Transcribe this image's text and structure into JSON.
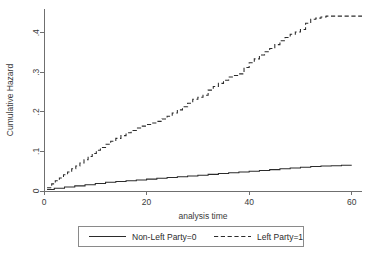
{
  "chart_data": {
    "type": "line",
    "title": "",
    "xlabel": "analysis time",
    "ylabel": "Cumulative Hazard",
    "xlim": [
      0,
      62
    ],
    "ylim": [
      0,
      0.46
    ],
    "xticks": [
      0,
      20,
      40,
      60
    ],
    "xtick_labels": [
      "0",
      "20",
      "40",
      "60"
    ],
    "yticks": [
      0,
      0.1,
      0.2,
      0.3,
      0.4
    ],
    "ytick_labels": [
      "0",
      ".1",
      ".2",
      ".3",
      ".4"
    ],
    "grid": false,
    "legend_position": "bottom-center",
    "series": [
      {
        "name": "Non-Left Party=0",
        "style": "solid",
        "color": "#2b2b2b",
        "step": "post",
        "x": [
          0.6,
          2,
          4,
          6,
          8,
          10,
          12,
          14,
          16,
          18,
          20,
          22,
          24,
          26,
          28,
          30,
          32,
          34,
          36,
          38,
          40,
          42,
          44,
          46,
          48,
          50,
          52,
          54,
          56,
          58,
          60
        ],
        "y": [
          0.004,
          0.007,
          0.01,
          0.013,
          0.016,
          0.019,
          0.022,
          0.024,
          0.026,
          0.028,
          0.03,
          0.032,
          0.034,
          0.036,
          0.038,
          0.04,
          0.042,
          0.044,
          0.046,
          0.048,
          0.05,
          0.052,
          0.054,
          0.056,
          0.058,
          0.06,
          0.062,
          0.063,
          0.064,
          0.065,
          0.065
        ]
      },
      {
        "name": "Left Party=1",
        "style": "dashed",
        "color": "#2b2b2b",
        "step": "post",
        "x": [
          0.6,
          1.5,
          2.2,
          3.0,
          3.8,
          4.6,
          5.4,
          6.2,
          7.0,
          7.8,
          8.6,
          9.4,
          10.2,
          11.0,
          12.0,
          13.0,
          14.0,
          15.0,
          16.0,
          17.0,
          18.0,
          19.0,
          20.0,
          21.0,
          22.0,
          23.0,
          24.0,
          25.0,
          26.0,
          27.0,
          28.0,
          29.0,
          30.0,
          31.0,
          32.0,
          33.0,
          34.0,
          35.0,
          36.0,
          37.0,
          38.0,
          39.0,
          40.0,
          41.0,
          42.0,
          43.0,
          44.0,
          45.0,
          46.0,
          47.0,
          48.0,
          49.0,
          50.0,
          51.0,
          52.0,
          53.0,
          54.0,
          55.0,
          62.0
        ],
        "y": [
          0.008,
          0.018,
          0.026,
          0.033,
          0.041,
          0.048,
          0.056,
          0.063,
          0.071,
          0.079,
          0.087,
          0.095,
          0.103,
          0.11,
          0.118,
          0.126,
          0.133,
          0.14,
          0.147,
          0.153,
          0.159,
          0.164,
          0.168,
          0.172,
          0.176,
          0.182,
          0.189,
          0.197,
          0.205,
          0.213,
          0.222,
          0.232,
          0.237,
          0.242,
          0.255,
          0.264,
          0.272,
          0.28,
          0.288,
          0.292,
          0.296,
          0.312,
          0.324,
          0.334,
          0.344,
          0.352,
          0.36,
          0.37,
          0.38,
          0.388,
          0.396,
          0.402,
          0.408,
          0.424,
          0.434,
          0.437,
          0.44,
          0.442,
          0.442
        ]
      }
    ]
  },
  "legend": {
    "entries": [
      {
        "label": "Non-Left Party=0",
        "style": "solid"
      },
      {
        "label": "Left Party=1",
        "style": "dashed"
      }
    ]
  }
}
